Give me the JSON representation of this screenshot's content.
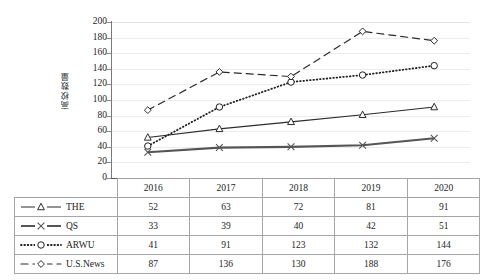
{
  "chart_data": {
    "type": "line",
    "title": "",
    "xlabel": "",
    "ylabel": "高校数量",
    "categories": [
      "2016",
      "2017",
      "2018",
      "2019",
      "2020"
    ],
    "ylim": [
      0,
      200
    ],
    "ytick_step": 20,
    "yticks": [
      "200",
      "180",
      "160",
      "140",
      "120",
      "100",
      "80",
      "60",
      "40",
      "20",
      "0"
    ],
    "grid": true,
    "legend_position": "table-left-column",
    "series": [
      {
        "name": "THE",
        "values": [
          52,
          63,
          72,
          81,
          91
        ],
        "marker": "triangle",
        "line_style": "solid",
        "color": "#2b2b2b",
        "line_width": 1.1
      },
      {
        "name": "QS",
        "values": [
          33,
          39,
          40,
          42,
          51
        ],
        "marker": "cross",
        "line_style": "solid",
        "color": "#555555",
        "line_width": 2.2
      },
      {
        "name": "ARWU",
        "values": [
          41,
          91,
          123,
          132,
          144
        ],
        "marker": "circle",
        "line_style": "dotted",
        "color": "#1f1f1f",
        "line_width": 1.8
      },
      {
        "name": "U.S.News",
        "values": [
          87,
          136,
          130,
          188,
          176
        ],
        "marker": "diamond",
        "line_style": "dashed",
        "color": "#2b2b2b",
        "line_width": 1.2
      }
    ]
  },
  "data_table": {
    "corner_label": "",
    "column_headers": [
      "2016",
      "2017",
      "2018",
      "2019",
      "2020"
    ],
    "rows": [
      {
        "label": "THE",
        "values": [
          "52",
          "63",
          "72",
          "81",
          "91"
        ]
      },
      {
        "label": "QS",
        "values": [
          "33",
          "39",
          "40",
          "42",
          "51"
        ]
      },
      {
        "label": "ARWU",
        "values": [
          "41",
          "91",
          "123",
          "132",
          "144"
        ]
      },
      {
        "label": "U.S.News",
        "values": [
          "87",
          "136",
          "130",
          "188",
          "176"
        ]
      }
    ]
  },
  "colors": {
    "grid": "#ececec",
    "axis": "#5a5a5a",
    "border": "#a6a6a6",
    "text": "#1d1d1d",
    "background": "#ffffff"
  }
}
